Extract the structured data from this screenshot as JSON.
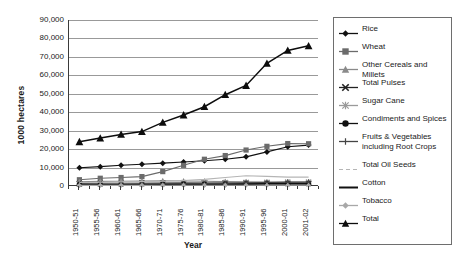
{
  "chart_data": {
    "type": "line",
    "title": "",
    "xlabel": "Year",
    "ylabel": "1000 hectares",
    "ylim": [
      0,
      90000
    ],
    "ytick_labels": [
      "90,000",
      "80,000",
      "70,000",
      "60,000",
      "50,000",
      "40,000",
      "30,000",
      "20,000",
      "10,000",
      "0"
    ],
    "ytick_values": [
      90000,
      80000,
      70000,
      60000,
      50000,
      40000,
      30000,
      20000,
      10000,
      0
    ],
    "grid": true,
    "legend_position": "right",
    "categories": [
      "1950-51",
      "1955-56",
      "1960-61",
      "1965-66",
      "1970-71",
      "1975-76",
      "1980-81",
      "1985-86",
      "1990-91",
      "1995-96",
      "2000-01",
      "2001-02"
    ],
    "series": [
      {
        "name": "Rice",
        "marker": "diamond",
        "color": "#111111",
        "values": [
          9900,
          10500,
          11300,
          11800,
          12400,
          13000,
          13700,
          14500,
          15800,
          18500,
          21300,
          22200
        ]
      },
      {
        "name": "Wheat",
        "marker": "square",
        "color": "#6b6b6b",
        "values": [
          3400,
          4200,
          4600,
          5100,
          7800,
          11200,
          14500,
          16500,
          19500,
          21500,
          23000,
          22900
        ]
      },
      {
        "name": "Other Cereals and Millets",
        "marker": "triangle",
        "color": "#8a8a8a",
        "values": [
          2300,
          2500,
          2600,
          2700,
          2800,
          2700,
          2600,
          2400,
          2300,
          2100,
          1900,
          1900
        ]
      },
      {
        "name": "Total Pulses",
        "marker": "cross",
        "color": "#222222",
        "values": [
          1300,
          1400,
          1500,
          1500,
          1600,
          1700,
          1700,
          1700,
          1700,
          1600,
          1500,
          1500
        ]
      },
      {
        "name": "Sugar Cane",
        "marker": "star",
        "color": "#9a9a9a",
        "values": [
          1100,
          1200,
          1300,
          1400,
          1500,
          1600,
          1700,
          1800,
          1900,
          2000,
          2100,
          2100
        ]
      },
      {
        "name": "Condiments and Spices",
        "marker": "circle",
        "color": "#111111",
        "values": [
          900,
          950,
          1000,
          1050,
          1100,
          1150,
          1200,
          1250,
          1300,
          1350,
          1400,
          1400
        ]
      },
      {
        "name": "Fruits & Vegetables including Root Crops",
        "marker": "plus",
        "color": "#444444",
        "values": [
          700,
          800,
          900,
          1000,
          1100,
          1200,
          1350,
          1500,
          1700,
          1900,
          2100,
          2150
        ]
      },
      {
        "name": "Total Oil Seeds",
        "marker": "dash",
        "color": "#b5b5b5",
        "values": [
          1900,
          2000,
          2200,
          2400,
          2600,
          3000,
          3600,
          4600,
          5600,
          5200,
          4800,
          4800
        ]
      },
      {
        "name": "Cotton",
        "marker": "line",
        "color": "#111111",
        "values": [
          600,
          650,
          700,
          700,
          750,
          750,
          800,
          800,
          850,
          900,
          900,
          900
        ]
      },
      {
        "name": "Tobacco",
        "marker": "diamond-gray",
        "color": "#a8a8a8",
        "values": [
          300,
          320,
          340,
          350,
          360,
          370,
          380,
          390,
          400,
          410,
          420,
          420
        ]
      },
      {
        "name": "Total",
        "marker": "triangle-black",
        "color": "#0d0d0d",
        "values": [
          24000,
          26000,
          28000,
          29500,
          34500,
          38500,
          43000,
          49500,
          54500,
          66500,
          73500,
          76000
        ]
      }
    ]
  },
  "legend": {
    "items": [
      {
        "label": "Rice",
        "icon": "diamond-marker-icon"
      },
      {
        "label": "Wheat",
        "icon": "square-marker-icon"
      },
      {
        "label": "Other Cereals and Millets",
        "icon": "triangle-marker-icon"
      },
      {
        "label": "Total Pulses",
        "icon": "cross-marker-icon"
      },
      {
        "label": "Sugar Cane",
        "icon": "star-marker-icon"
      },
      {
        "label": "Condiments and Spices",
        "icon": "circle-marker-icon"
      },
      {
        "label": "Fruits & Vegetables including Root Crops",
        "icon": "plus-marker-icon"
      },
      {
        "label": "Total Oil Seeds",
        "icon": "dash-marker-icon"
      },
      {
        "label": "Cotton",
        "icon": "line-marker-icon"
      },
      {
        "label": "Tobacco",
        "icon": "diamond-gray-marker-icon"
      },
      {
        "label": "Total",
        "icon": "triangle-black-marker-icon"
      }
    ]
  }
}
